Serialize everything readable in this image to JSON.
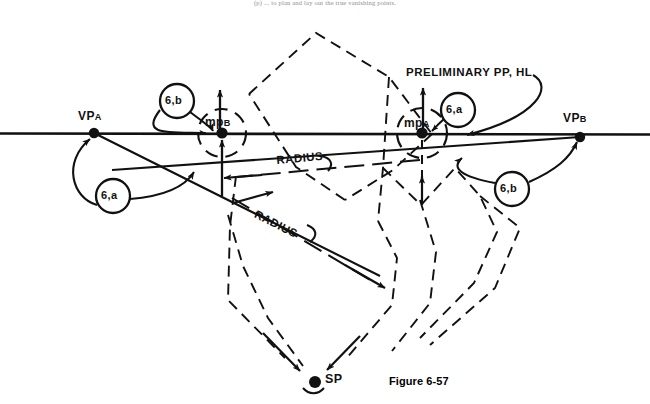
{
  "figure": {
    "caption": "Figure 6-57",
    "running_head": "(p) ... to plan and lay out the true vanishing points.",
    "domain_note": "perspective-drawing-construction"
  },
  "labels": {
    "vp_a": {
      "main": "VP",
      "sub": "A"
    },
    "vp_b": {
      "main": "VP",
      "sub": "B"
    },
    "mp_a": {
      "main": "mp",
      "sub": "A"
    },
    "mp_b": {
      "main": "mp",
      "sub": "B"
    },
    "sp": {
      "main": "SP"
    },
    "preliminary": "PRELIMINARY PP, HL",
    "radius_upper": "RADIUS",
    "radius_lower": "RADIUS"
  },
  "step_circles": [
    {
      "id": "left-6a",
      "text": "6,a",
      "cx": 113,
      "cy": 196,
      "r": 17
    },
    {
      "id": "upper-6b",
      "text": "6,b",
      "cx": 177,
      "cy": 101,
      "r": 17
    },
    {
      "id": "upper-6a",
      "text": "6,a",
      "cx": 458,
      "cy": 110,
      "r": 17
    },
    {
      "id": "right-6b",
      "text": "6,b",
      "cx": 512,
      "cy": 189,
      "r": 17
    }
  ],
  "points": [
    {
      "id": "vp-a",
      "x": 94,
      "y": 133
    },
    {
      "id": "mp-b",
      "x": 222,
      "y": 133
    },
    {
      "id": "mp-a",
      "x": 422,
      "y": 133
    },
    {
      "id": "vp-b",
      "x": 580,
      "y": 137
    },
    {
      "id": "sp",
      "x": 315,
      "y": 382
    }
  ],
  "geometry": {
    "horizon_line": {
      "x1": 0,
      "y1": 133,
      "x2": 650,
      "y2": 134
    },
    "description": "Horizon line (HL) with two vanishing points, two measuring points and station point SP below."
  },
  "colors": {
    "ink": "#111111",
    "paper": "#ffffff",
    "header_gray": "#8d8d8d"
  }
}
